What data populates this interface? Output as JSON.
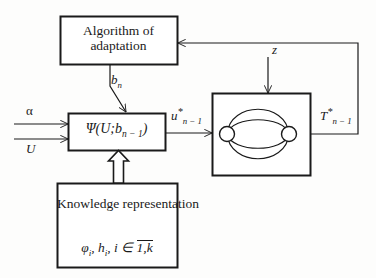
{
  "diagram": {
    "background_color": "#fdfdfc",
    "stroke_color": "#1a1a1a"
  },
  "blocks": {
    "algorithm": {
      "name": "algorithm-of-adaptation-block",
      "line1": "Algorithm of",
      "line2": "adaptation"
    },
    "psi": {
      "name": "psi-operator-block",
      "formula_prefix": "Ψ(U;b",
      "formula_sub": "n − 1",
      "formula_suffix": ")"
    },
    "knowledge": {
      "name": "knowledge-representation-block",
      "line1": "Knowledge",
      "line2": "representation",
      "formula_phi": "φ",
      "formula_phi_sub": "i",
      "formula_sep1": ", ",
      "formula_h": "h",
      "formula_h_sub": "i",
      "formula_sep2": ", ",
      "formula_i": "i ∈ ",
      "formula_range": "1,k"
    },
    "plant": {
      "name": "plant-graph-block",
      "node_count": 2,
      "arc_count": 4
    }
  },
  "signals": {
    "b_n": {
      "base": "b",
      "sub": "n"
    },
    "z": {
      "base": "z"
    },
    "alpha": {
      "base": "α"
    },
    "U": {
      "base": "U"
    },
    "u_star": {
      "base": "u",
      "star": "*",
      "sub": "n − 1"
    },
    "T_star": {
      "base": "T",
      "star": "*",
      "sub": "n − 1"
    }
  },
  "connections": [
    {
      "name": "alpha-input-arrow",
      "from": "external-left",
      "to": "psi-operator-block",
      "label": "α"
    },
    {
      "name": "U-input-arrow",
      "from": "external-left",
      "to": "psi-operator-block",
      "label": "U"
    },
    {
      "name": "bn-arrow",
      "from": "algorithm-of-adaptation-block",
      "to": "psi-operator-block",
      "label": "b_n"
    },
    {
      "name": "knowledge-arrow",
      "from": "knowledge-representation-block",
      "to": "psi-operator-block",
      "style": "hollow-block-arrow"
    },
    {
      "name": "u-star-arrow",
      "from": "psi-operator-block",
      "to": "plant-graph-block",
      "label": "u*_{n-1}"
    },
    {
      "name": "z-disturbance-arrow",
      "from": "external-top",
      "to": "plant-graph-block",
      "label": "z"
    },
    {
      "name": "feedback-arrow",
      "from": "plant-graph-block",
      "to": "algorithm-of-adaptation-block",
      "label": "T*_{n-1}"
    }
  ]
}
